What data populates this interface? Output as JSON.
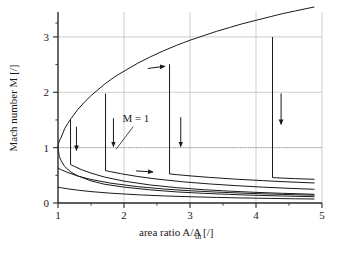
{
  "chart_data": {
    "type": "line",
    "title": "",
    "xlabel": "area ratio A/A_th [/]",
    "xlabel_parts": {
      "main": "area ratio A/A",
      "sub": "th",
      "tail": " [/]"
    },
    "ylabel": "Mach number M [/]",
    "xlim": [
      1,
      5
    ],
    "ylim": [
      0,
      3.45
    ],
    "xticks": [
      1,
      2,
      3,
      4,
      5
    ],
    "xtick_labels": [
      "1",
      "2",
      "3",
      "4",
      "5"
    ],
    "xminorticks": [
      1.5,
      2.5,
      3.5,
      4.5
    ],
    "yticks": [
      0,
      1,
      2,
      3
    ],
    "ytick_labels": [
      "0",
      "1",
      "2",
      "3"
    ],
    "yminorticks": [
      0.5,
      1.5,
      2.5,
      3.25
    ],
    "grid": true,
    "grid_color": "#b9b9b9",
    "axis_color": "#2a2a2a",
    "curve_color": "#1a1a1a",
    "background": "#ffffff",
    "legend": "none",
    "annotations": [
      {
        "name": "mach-one-label",
        "text": "M = 1",
        "x": 2.18,
        "y": 1.46
      },
      {
        "name": "mach-one-leader",
        "type": "leader",
        "x1": 2.14,
        "y1": 1.38,
        "x2": 1.88,
        "y2": 0.97
      },
      {
        "name": "supersonic-flow-arrow",
        "type": "arrow",
        "direction": "right",
        "x1": 2.36,
        "y1": 2.43,
        "x2": 2.62,
        "y2": 2.47
      },
      {
        "name": "subsonic-flow-arrow",
        "type": "arrow",
        "direction": "right",
        "x1": 2.18,
        "y1": 0.58,
        "x2": 2.44,
        "y2": 0.56
      },
      {
        "name": "shock-arrow-1",
        "type": "arrow",
        "direction": "down",
        "x1": 1.28,
        "y1": 1.38,
        "x2": 1.28,
        "y2": 0.95
      },
      {
        "name": "shock-arrow-2",
        "type": "arrow",
        "direction": "down",
        "x1": 1.84,
        "y1": 1.53,
        "x2": 1.84,
        "y2": 1.02
      },
      {
        "name": "shock-arrow-3",
        "type": "arrow",
        "direction": "down",
        "x1": 2.86,
        "y1": 1.55,
        "x2": 2.86,
        "y2": 1.02
      },
      {
        "name": "shock-arrow-4",
        "type": "arrow",
        "direction": "down",
        "x1": 4.38,
        "y1": 1.98,
        "x2": 4.38,
        "y2": 1.42
      }
    ],
    "series": [
      {
        "name": "supersonic-branch",
        "role": "isentropic supersonic solution",
        "x": [
          1.0,
          1.005,
          1.02,
          1.05,
          1.1,
          1.15,
          1.2,
          1.3,
          1.4,
          1.5,
          1.6,
          1.7,
          1.8,
          1.9,
          2.0,
          2.2,
          2.4,
          2.6,
          2.8,
          3.0,
          3.2,
          3.4,
          3.6,
          3.8,
          4.0,
          4.2,
          4.4,
          4.6,
          4.8,
          4.88
        ],
        "y": [
          1.0,
          1.06,
          1.12,
          1.19,
          1.34,
          1.44,
          1.53,
          1.69,
          1.82,
          1.94,
          2.04,
          2.14,
          2.23,
          2.31,
          2.38,
          2.52,
          2.64,
          2.75,
          2.85,
          2.94,
          3.02,
          3.1,
          3.17,
          3.24,
          3.3,
          3.36,
          3.42,
          3.47,
          3.52,
          3.54
        ]
      },
      {
        "name": "subsonic-branch-isentropic",
        "role": "isentropic subsonic solution",
        "x": [
          1.0,
          1.02,
          1.05,
          1.1,
          1.2,
          1.3,
          1.5,
          1.7,
          2.0,
          2.4,
          2.8,
          3.2,
          3.6,
          4.0,
          4.4,
          4.88
        ],
        "y": [
          1.0,
          0.84,
          0.76,
          0.66,
          0.555,
          0.49,
          0.4,
          0.34,
          0.287,
          0.237,
          0.2,
          0.175,
          0.155,
          0.139,
          0.126,
          0.114
        ]
      },
      {
        "name": "shock-branch-1",
        "role": "normal shock at A/Ath = 1.19",
        "shock_x": 1.19,
        "shock_y_pre": 1.51,
        "shock_y_post": 0.695,
        "x": [
          1.19,
          1.25,
          1.35,
          1.5,
          1.7,
          2.0,
          2.4,
          2.8,
          3.2,
          3.6,
          4.0,
          4.4,
          4.88
        ],
        "y": [
          0.695,
          0.66,
          0.605,
          0.54,
          0.47,
          0.395,
          0.325,
          0.277,
          0.241,
          0.214,
          0.192,
          0.175,
          0.158
        ]
      },
      {
        "name": "shock-branch-2",
        "role": "normal shock at A/Ath = 1.72",
        "shock_x": 1.72,
        "shock_y_pre": 1.97,
        "shock_y_post": 0.585,
        "x": [
          1.72,
          1.8,
          1.95,
          2.2,
          2.5,
          2.9,
          3.3,
          3.7,
          4.1,
          4.5,
          4.88
        ],
        "y": [
          0.585,
          0.565,
          0.53,
          0.48,
          0.432,
          0.382,
          0.344,
          0.313,
          0.287,
          0.265,
          0.248
        ]
      },
      {
        "name": "shock-branch-3",
        "role": "normal shock at A/Ath = 2.69",
        "shock_x": 2.69,
        "shock_y_pre": 2.5,
        "shock_y_post": 0.525,
        "x": [
          2.69,
          2.8,
          3.0,
          3.3,
          3.7,
          4.1,
          4.5,
          4.88
        ],
        "y": [
          0.525,
          0.512,
          0.49,
          0.462,
          0.43,
          0.404,
          0.381,
          0.362
        ]
      },
      {
        "name": "shock-branch-4",
        "role": "normal shock at A/Ath = 4.25",
        "shock_x": 4.25,
        "shock_y_pre": 2.99,
        "shock_y_post": 0.458,
        "x": [
          4.25,
          4.4,
          4.6,
          4.88
        ],
        "y": [
          0.458,
          0.45,
          0.44,
          0.428
        ]
      },
      {
        "name": "lower-subsonic-curve",
        "role": "low back-pressure subsonic solution",
        "x": [
          1.0,
          1.05,
          1.15,
          1.3,
          1.5,
          1.8,
          2.2,
          2.6,
          3.0,
          3.4,
          3.8,
          4.2,
          4.6,
          4.88
        ],
        "y": [
          0.285,
          0.275,
          0.256,
          0.232,
          0.206,
          0.177,
          0.149,
          0.128,
          0.113,
          0.101,
          0.091,
          0.083,
          0.076,
          0.072
        ]
      },
      {
        "name": "mid-subsonic-curve",
        "role": "intermediate subsonic solution",
        "x": [
          1.0,
          1.05,
          1.15,
          1.3,
          1.5,
          1.8,
          2.2,
          2.6,
          3.0,
          3.4,
          3.8,
          4.2,
          4.6,
          4.88
        ],
        "y": [
          0.63,
          0.6,
          0.55,
          0.487,
          0.425,
          0.358,
          0.296,
          0.253,
          0.221,
          0.197,
          0.178,
          0.162,
          0.149,
          0.141
        ]
      }
    ],
    "m_equals_one_line": {
      "y": 1.0,
      "style": "dotted",
      "color": "#9a9a9a"
    }
  }
}
